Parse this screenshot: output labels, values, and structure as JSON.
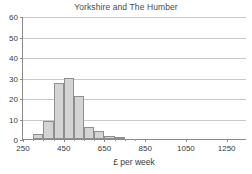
{
  "chart_data": {
    "type": "bar",
    "title": "Yorkshire and The Humber",
    "xlabel": "£ per week",
    "ylabel": "",
    "xlim": [
      250,
      1350
    ],
    "ylim": [
      0,
      60
    ],
    "grid": true,
    "legend": "none",
    "bin_width": 50,
    "xticks": [
      250,
      450,
      650,
      850,
      1050,
      1250
    ],
    "xtick_labels": [
      "250",
      "450",
      "650",
      "850",
      "1050",
      "1250"
    ],
    "yticks": [
      0,
      10,
      20,
      30,
      40,
      50,
      60
    ],
    "ytick_labels": [
      "0",
      "10",
      "20",
      "30",
      "40",
      "50",
      "60"
    ],
    "bins": [
      {
        "x0": 300,
        "x1": 350,
        "value": 2.3
      },
      {
        "x0": 350,
        "x1": 400,
        "value": 9.0
      },
      {
        "x0": 400,
        "x1": 450,
        "value": 27.5
      },
      {
        "x0": 450,
        "x1": 500,
        "value": 29.8
      },
      {
        "x0": 500,
        "x1": 550,
        "value": 20.8
      },
      {
        "x0": 550,
        "x1": 600,
        "value": 6.0
      },
      {
        "x0": 600,
        "x1": 650,
        "value": 4.0
      },
      {
        "x0": 650,
        "x1": 700,
        "value": 1.6
      },
      {
        "x0": 700,
        "x1": 750,
        "value": 0.5
      }
    ],
    "colors": {
      "bar_fill": "#d4d4d4",
      "bar_stroke": "#8f8f8f",
      "gridline": "#c9c9c9",
      "axis": "#8a8a8a",
      "text": "#3a3a3a",
      "title": "#4a4a4a",
      "background": "#ffffff"
    }
  }
}
